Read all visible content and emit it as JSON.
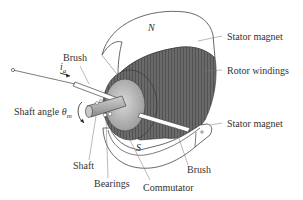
{
  "diagram": {
    "labels": {
      "brush_top": "Brush",
      "current": "i",
      "current_sub": "a",
      "stator_top": "Stator magnet",
      "rotor": "Rotor windings",
      "shaft_angle": "Shaft angle ",
      "theta": "θ",
      "theta_sub": "m",
      "stator_bottom": "Stator magnet",
      "shaft": "Shaft",
      "brush_bottom": "Brush",
      "bearings": "Bearings",
      "commutator": "Commutator",
      "pole_n": "N",
      "pole_s": "S"
    },
    "colors": {
      "line": "#444444",
      "text": "#333333",
      "winding_dark": "#4a4a4a",
      "winding_mid": "#7a7a7a",
      "commutator": "#bdbdbd",
      "shaft": "#a8a8a8",
      "magnet_fill": "#ffffff"
    }
  }
}
